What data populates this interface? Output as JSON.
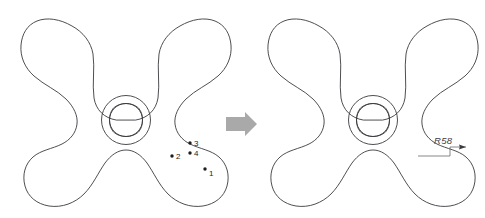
{
  "figure": {
    "background_color": "#ffffff",
    "line_color": "#3b3b40",
    "point_color": "#1d1d1f",
    "flow_arrow_color": "#a9a9a9",
    "dimension_color": "#6a6a70"
  },
  "left_view": {
    "name": "construction-points-view",
    "caption": "",
    "points": [
      {
        "label": "1",
        "x": 205,
        "y": 169,
        "label_x": 209,
        "label_y": 176
      },
      {
        "label": "2",
        "x": 172,
        "y": 156,
        "label_x": 176,
        "label_y": 159
      },
      {
        "label": "3",
        "x": 190,
        "y": 143,
        "label_x": 194,
        "label_y": 146
      },
      {
        "label": "4",
        "x": 190,
        "y": 153,
        "label_x": 194,
        "label_y": 156
      }
    ]
  },
  "flow": {
    "name": "process-arrow",
    "direction": "right",
    "color": "#a9a9a9"
  },
  "right_view": {
    "name": "dimensioned-view",
    "dimensions": [
      {
        "label": "R58",
        "text_x": 434,
        "text_y": 144,
        "kind": "radius"
      }
    ]
  }
}
